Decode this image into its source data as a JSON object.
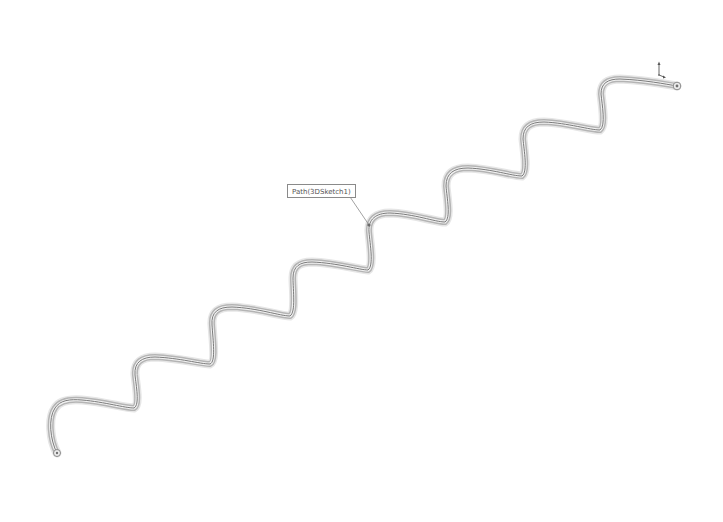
{
  "viewport": {
    "background": "#ffffff",
    "header_text": ""
  },
  "model": {
    "name": "Path(3DSketch1)",
    "type": "swept-tube",
    "waves": 7,
    "tube_color": "#a8a8a8",
    "tube_outline": "#d0d0d0",
    "centerline_color": "#707070"
  },
  "callout": {
    "label": "Path(3DSketch1)",
    "border_color": "#8a8a8a"
  },
  "triad": {
    "label": "coordinate-triad"
  }
}
